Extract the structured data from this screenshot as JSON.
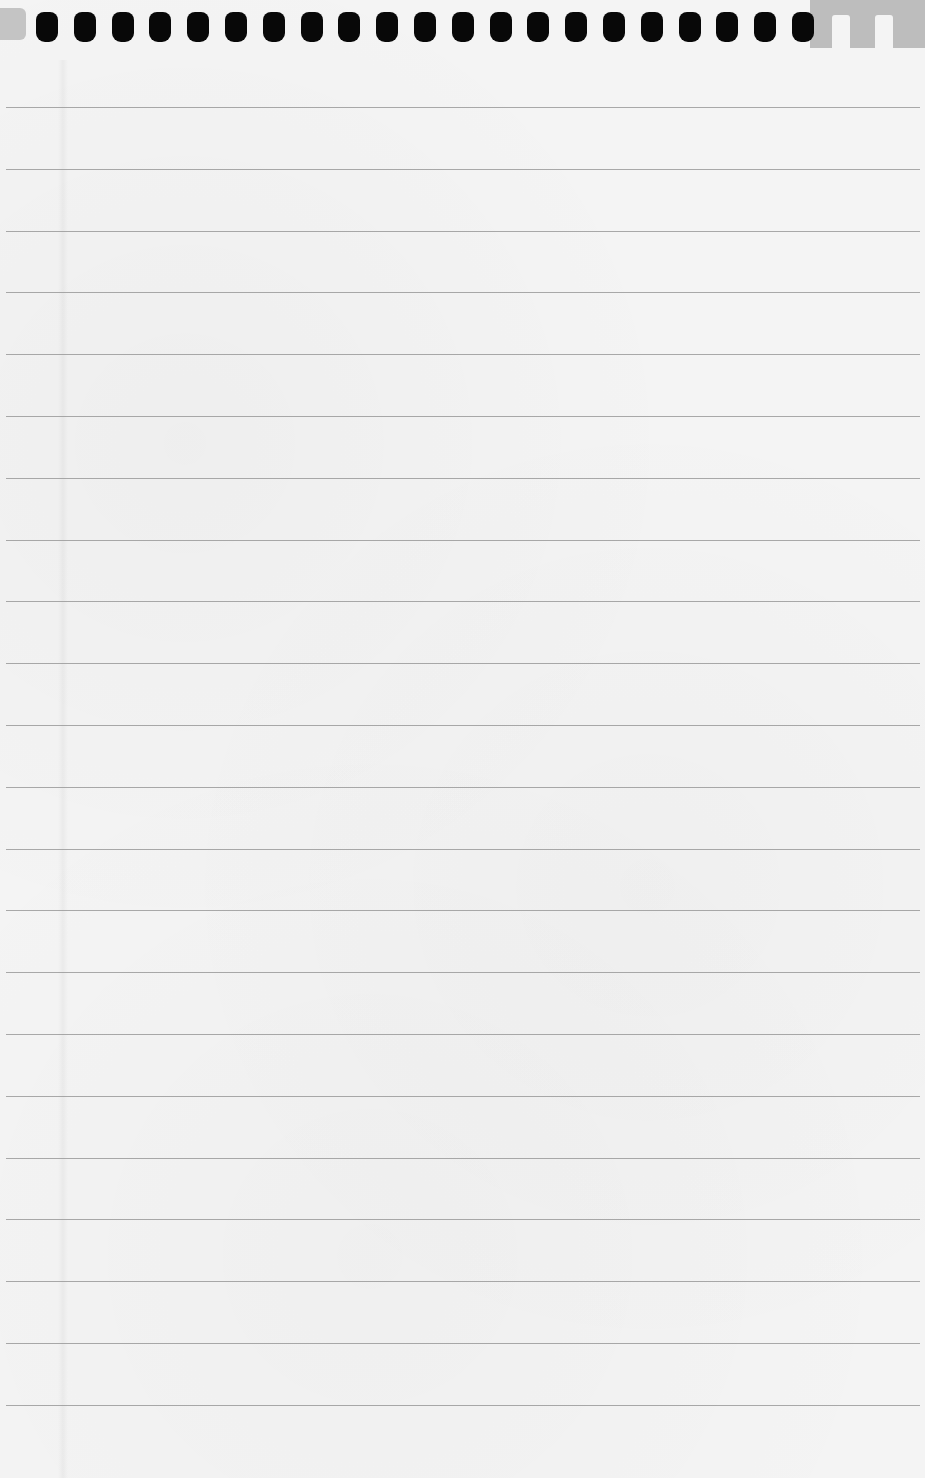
{
  "page": {
    "type": "blank lined notepad sheet",
    "paper_color": "#f4f4f4",
    "rule_color": "#9a9a9a",
    "hole_color": "#080808",
    "torn_area_color": "#bdbdbd"
  },
  "binding_holes": {
    "count": 21,
    "first_x": 36,
    "spacing": 37.8
  },
  "ruled_lines": {
    "count": 22,
    "first_y": 107,
    "spacing": 61.8
  },
  "text_content": []
}
